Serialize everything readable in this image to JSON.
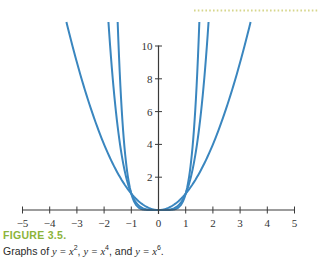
{
  "colors": {
    "curve": "#3a86bf",
    "axis": "#3a3a3a",
    "figure_label": "#8cb43a",
    "dotted_rule": "#d6d68c"
  },
  "caption": {
    "label": "FIGURE 3.5.",
    "prefix": "Graphs of ",
    "eq1": "y = x",
    "exp1": "2",
    "sep1": ", ",
    "eq2": "y = x",
    "exp2": "4",
    "sep2": ", and ",
    "eq3": "y = x",
    "exp3": "6",
    "suffix": "."
  },
  "chart_data": {
    "type": "line",
    "title": "",
    "xlabel": "",
    "ylabel": "",
    "xlim": [
      -5,
      5
    ],
    "ylim": [
      0,
      10
    ],
    "x_ticks": [
      -5,
      -4,
      -3,
      -2,
      -1,
      0,
      1,
      2,
      3,
      4,
      5
    ],
    "x_tick_labels": [
      "−5",
      "−4",
      "−3",
      "−2",
      "−1",
      "0",
      "1",
      "2",
      "3",
      "4",
      "5"
    ],
    "y_ticks": [
      2,
      4,
      6,
      8,
      10
    ],
    "y_tick_labels": [
      "2",
      "4",
      "6",
      "8",
      "10"
    ],
    "grid": false,
    "legend": null,
    "series": [
      {
        "name": "y = x^2",
        "exponent": 2,
        "x": [
          -3.3,
          -3,
          -2,
          -1,
          0,
          1,
          2,
          3,
          3.3
        ],
        "values": [
          10.89,
          9,
          4,
          1,
          0,
          1,
          4,
          9,
          10.89
        ]
      },
      {
        "name": "y = x^4",
        "exponent": 4,
        "x": [
          -1.82,
          -1.5,
          -1,
          -0.5,
          0,
          0.5,
          1,
          1.5,
          1.82
        ],
        "values": [
          10.97,
          5.06,
          1,
          0.06,
          0,
          0.06,
          1,
          5.06,
          10.97
        ]
      },
      {
        "name": "y = x^6",
        "exponent": 6,
        "x": [
          -1.49,
          -1.25,
          -1,
          -0.5,
          0,
          0.5,
          1,
          1.25,
          1.49
        ],
        "values": [
          10.93,
          3.81,
          1,
          0.02,
          0,
          0.02,
          1,
          3.81,
          10.93
        ]
      }
    ],
    "annotations": [
      "FIGURE 3.5.",
      "Graphs of y = x², y = x⁴, and y = x⁶."
    ]
  }
}
